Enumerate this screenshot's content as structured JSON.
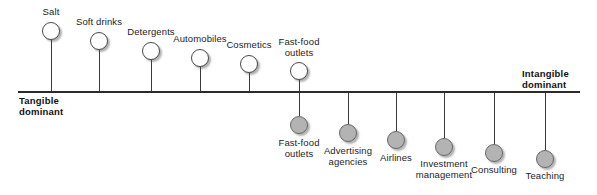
{
  "diagram": {
    "type": "annotated-axis",
    "axis": {
      "left_label": "Tangible\ndominant",
      "right_label": "Intangible\ndominant",
      "line_color": "#2b2b2b",
      "orientation": "horizontal"
    },
    "colors": {
      "open_bubble_fill": "#ffffff",
      "filled_bubble_fill": "#b3b3b3",
      "stroke": "#4a4a4a",
      "text": "#1d1d1d"
    },
    "items_above": [
      {
        "label": "Salt",
        "x": 51,
        "bubble_y": 22,
        "stem_top": 40,
        "stem_height": 51,
        "label_y": 7,
        "label_width": 50,
        "filled": false
      },
      {
        "label": "Soft drinks",
        "x": 99,
        "bubble_y": 32,
        "stem_top": 50,
        "stem_height": 41,
        "label_y": 17,
        "label_width": 62,
        "filled": false
      },
      {
        "label": "Detergents",
        "x": 151,
        "bubble_y": 42,
        "stem_top": 60,
        "stem_height": 31,
        "label_y": 27,
        "label_width": 62,
        "filled": false
      },
      {
        "label": "Automobiles",
        "x": 200,
        "bubble_y": 49,
        "stem_top": 67,
        "stem_height": 24,
        "label_y": 34,
        "label_width": 68,
        "filled": false
      },
      {
        "label": "Cosmetics",
        "x": 249,
        "bubble_y": 55,
        "stem_top": 73,
        "stem_height": 18,
        "label_y": 40,
        "label_width": 60,
        "filled": false
      },
      {
        "label": "Fast-food\noutlets",
        "x": 299,
        "bubble_y": 62,
        "stem_top": 80,
        "stem_height": 11,
        "label_y": 37,
        "label_width": 56,
        "filled": false
      }
    ],
    "items_below": [
      {
        "label": "Fast-food\noutlets",
        "x": 299,
        "bubble_y": 116,
        "stem_top": 93,
        "stem_height": 23,
        "label_y": 138,
        "label_width": 56,
        "filled": true
      },
      {
        "label": "Advertising\nagencies",
        "x": 348,
        "bubble_y": 124,
        "stem_top": 93,
        "stem_height": 31,
        "label_y": 146,
        "label_width": 64,
        "filled": true
      },
      {
        "label": "Airlines",
        "x": 396,
        "bubble_y": 131,
        "stem_top": 93,
        "stem_height": 38,
        "label_y": 153,
        "label_width": 50,
        "filled": true
      },
      {
        "label": "Investment\nmanagement",
        "x": 444,
        "bubble_y": 138,
        "stem_top": 93,
        "stem_height": 45,
        "label_y": 159,
        "label_width": 76,
        "filled": true
      },
      {
        "label": "Consulting",
        "x": 494,
        "bubble_y": 144,
        "stem_top": 93,
        "stem_height": 51,
        "label_y": 165,
        "label_width": 62,
        "filled": true
      },
      {
        "label": "Teaching",
        "x": 545,
        "bubble_y": 150,
        "stem_top": 93,
        "stem_height": 57,
        "label_y": 171,
        "label_width": 56,
        "filled": true
      }
    ]
  }
}
